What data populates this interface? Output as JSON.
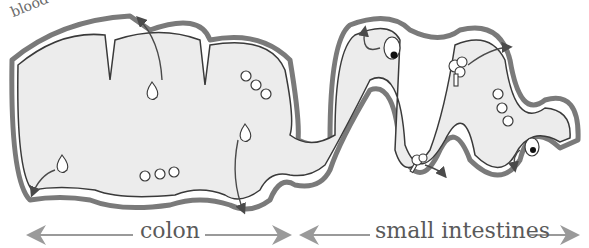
{
  "labels": {
    "blood_vessels": "blood vessels",
    "colon": "colon",
    "small_intestines": "small intestines"
  },
  "colors": {
    "lumen_fill": "#ececec",
    "vessel_stroke": "#7a7a7a",
    "wall_stroke": "#3a3a3a",
    "label_text": "#5a5a5a",
    "span_arrow": "#9a9a9a"
  },
  "regions": [
    {
      "name": "colon",
      "span_px": [
        25,
        290
      ]
    },
    {
      "name": "small_intestines",
      "span_px": [
        300,
        578
      ]
    }
  ],
  "particles": [
    {
      "type": "water-drop",
      "region": "colon",
      "count": 4
    },
    {
      "type": "bead-chain",
      "region": "colon",
      "count": 2,
      "beads_each": 3
    },
    {
      "type": "bead-chain",
      "region": "small_intestines",
      "count": 1,
      "beads_each": 3
    },
    {
      "type": "cell-with-nucleus",
      "region": "small_intestines",
      "count": 2
    },
    {
      "type": "tree-molecule",
      "region": "small_intestines",
      "count": 2
    }
  ]
}
